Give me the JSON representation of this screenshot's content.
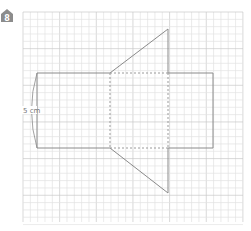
{
  "question": {
    "number": "8",
    "icon": "house-number-badge"
  },
  "diagram": {
    "type": "net-on-grid",
    "dimension_label": "5 cm",
    "colors": {
      "grid_minor": "#e2e2e2",
      "grid_major": "#c8c8c8",
      "outline": "#8a8a8a",
      "dashed": "#9a9a9a",
      "label": "#777777",
      "badge": "#8c8c8c"
    }
  }
}
